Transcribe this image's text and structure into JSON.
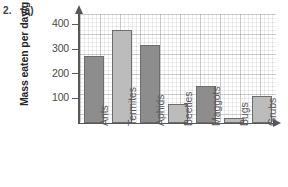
{
  "question": {
    "number": "2.",
    "part": "(a)"
  },
  "chart_data": {
    "type": "bar",
    "title": "",
    "xlabel": "",
    "ylabel": "Mass eaten per day/g",
    "ylim": [
      0,
      450
    ],
    "yticks": [
      100,
      200,
      300,
      400
    ],
    "grid": true,
    "legend": "none",
    "categories": [
      "Ants",
      "Termites",
      "Aphids",
      "Beetles",
      "Maggots",
      "Bugs",
      "Grubs"
    ],
    "values": [
      275,
      380,
      320,
      75,
      150,
      20,
      110
    ],
    "bar_colors": [
      "#8d8d8d",
      "#bcbcbc",
      "#8d8d8d",
      "#bcbcbc",
      "#8d8d8d",
      "#bcbcbc",
      "#bcbcbc"
    ],
    "bar_edge_color": "#6d6d6d",
    "axis_color": "#585858",
    "background": "#ffffff"
  }
}
